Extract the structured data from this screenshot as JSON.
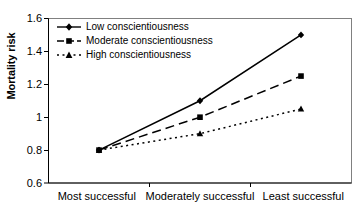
{
  "chart_data": {
    "type": "line",
    "title": "",
    "xlabel": "",
    "ylabel": "Mortality risk",
    "categories": [
      "Most successful",
      "Moderately successful",
      "Least successful"
    ],
    "ylim": [
      0.6,
      1.6
    ],
    "yticks": [
      1.6,
      1.4,
      1.2,
      1.0,
      0.8,
      0.6
    ],
    "ytick_labels": [
      "1.6",
      "1.4",
      "1.2",
      "1",
      "0.8",
      "0.6"
    ],
    "grid": false,
    "legend_position": "top-left",
    "series": [
      {
        "name": "Low conscientiousness",
        "values": [
          0.8,
          1.1,
          1.5
        ],
        "line_style": "solid",
        "marker": "diamond",
        "color": "#000000"
      },
      {
        "name": "Moderate conscientiousness",
        "values": [
          0.8,
          1.0,
          1.25
        ],
        "line_style": "dashed",
        "marker": "square",
        "color": "#000000"
      },
      {
        "name": "High conscientiousness",
        "values": [
          0.8,
          0.9,
          1.05
        ],
        "line_style": "dotted",
        "marker": "triangle",
        "color": "#000000"
      }
    ]
  },
  "axis": {
    "ytick_0": "1.6",
    "ytick_1": "1.4",
    "ytick_2": "1.2",
    "ytick_3": "1",
    "ytick_4": "0.8",
    "ytick_5": "0.6",
    "ylabel": "Mortality risk",
    "xcat_0": "Most successful",
    "xcat_1": "Moderately successful",
    "xcat_2": "Least successful"
  },
  "legend": {
    "item_0": "Low conscientiousness",
    "item_1": "Moderate conscientiousness",
    "item_2": "High conscientiousness"
  }
}
